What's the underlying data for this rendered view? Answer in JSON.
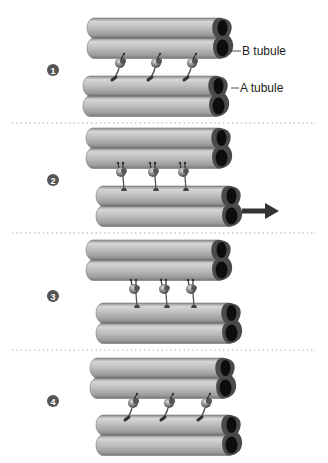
{
  "diagram": {
    "colors": {
      "tube_light": "#d2d2d2",
      "tube_mid": "#a9a9a9",
      "tube_dark": "#7e7e7e",
      "tube_end_ring": "#4a4a4a",
      "tube_lumen": "#0d0d0d",
      "dynein": "#7a7a7a",
      "badge": "#555555",
      "separator": "#9a9a9a",
      "arrow": "#333333"
    },
    "labels": {
      "b_tubule": "B tubule",
      "a_tubule": "A tubule"
    },
    "steps": [
      {
        "number": "1",
        "description": "Dynein arms on A tubule of lower doublet extend toward B tubule of upper doublet"
      },
      {
        "number": "2",
        "description": "Dynein heads bind the upper doublet; lower doublet slides (arrow)"
      },
      {
        "number": "3",
        "description": "Dynein arms release and reorient"
      },
      {
        "number": "4",
        "description": "Dynein arms reattach and cycle repeats"
      }
    ],
    "motion_arrow": {
      "panel": 2,
      "direction": "right"
    }
  }
}
